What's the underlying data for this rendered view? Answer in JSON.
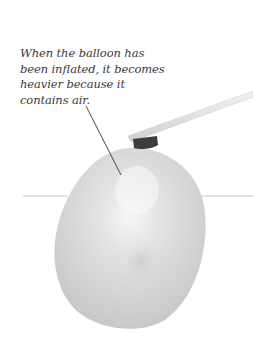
{
  "caption": {
    "lines": [
      "When the balloon has",
      "been inflated, it becomes",
      "heavier because it",
      "contains air."
    ]
  },
  "illustration": {
    "subject": "inflated balloon attached to a balance stick",
    "icons": [
      "balloon-icon",
      "stick-icon",
      "knot-icon",
      "pointer-line-icon"
    ],
    "colors": {
      "balloon": "#d6d6d6",
      "balloon_highlight": "#f4f4f4",
      "knot": "#3c3c3c",
      "stick": "#e2e2e2",
      "guide_line": "#dadada",
      "pointer": "#333333",
      "text": "#3a3a3a"
    }
  }
}
